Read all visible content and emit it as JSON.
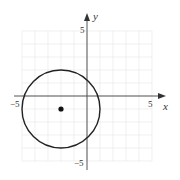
{
  "chart_data": {
    "type": "scatter",
    "title": "",
    "xlabel": "x",
    "ylabel": "y",
    "xlim": [
      -5,
      5
    ],
    "ylim": [
      -5,
      5
    ],
    "grid": true,
    "x_tick_labels": [
      "−5",
      "5"
    ],
    "y_tick_labels": [
      "5",
      "−5"
    ],
    "shapes": [
      {
        "type": "circle",
        "center": [
          -2,
          -1
        ],
        "radius": 3,
        "equation": "(x+2)^2 + (y+1)^2 = 9"
      }
    ],
    "points": [
      {
        "x": -2,
        "y": -1,
        "label": "center"
      }
    ]
  },
  "labels": {
    "x_axis": "x",
    "y_axis": "y",
    "x_min": "−5",
    "x_max": "5",
    "y_max": "5",
    "y_min": "−5"
  },
  "colors": {
    "curve": "#222222",
    "axis": "#555555",
    "grid": "#e6e6e6"
  }
}
